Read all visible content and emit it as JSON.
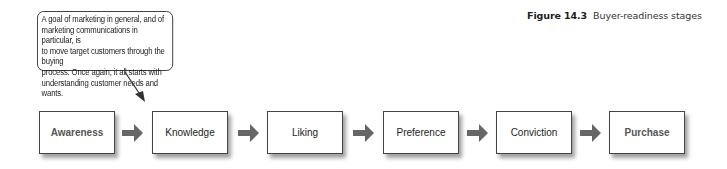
{
  "caption": {
    "number": "Figure 14.3",
    "title": "Buyer-readiness stages"
  },
  "callout": {
    "text": "A goal of marketing in general, and of\nmarketing communications in particular, is\nto move target customers through the buying\nprocess. Once again, it all starts with\nunderstanding customer needs and wants."
  },
  "stages": [
    {
      "label": "Awareness",
      "emphasis": true
    },
    {
      "label": "Knowledge",
      "emphasis": false
    },
    {
      "label": "Liking",
      "emphasis": false
    },
    {
      "label": "Preference",
      "emphasis": false
    },
    {
      "label": "Conviction",
      "emphasis": false
    },
    {
      "label": "Purchase",
      "emphasis": true
    }
  ],
  "colors": {
    "arrow": "#666666",
    "border": "#444444",
    "text": "#222222"
  }
}
